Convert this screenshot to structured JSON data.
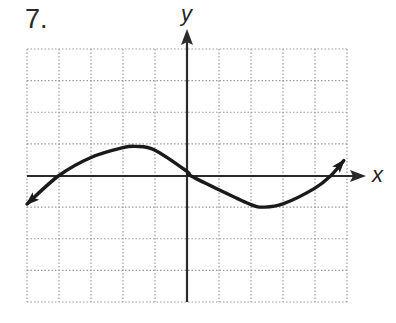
{
  "problem": {
    "number": "7."
  },
  "axes": {
    "x_label": "x",
    "y_label": "y"
  },
  "grid": {
    "columns": 10,
    "rows": 8,
    "x_min": -5,
    "x_max": 5,
    "y_min": -4,
    "y_max": 4,
    "line_style": "dotted",
    "line_color": "#9a9a9a"
  },
  "colors": {
    "curve": "#1a1a1a",
    "axis": "#2a2a2a",
    "background": "#ffffff"
  },
  "chart_data": {
    "type": "line",
    "title": "7.",
    "xlabel": "x",
    "ylabel": "y",
    "xlim": [
      -5,
      5
    ],
    "ylim": [
      -4,
      4
    ],
    "grid": true,
    "tick_labels": [],
    "series": [
      {
        "name": "curve",
        "arrows_both_ends": true,
        "x": [
          -5.0,
          -4.0,
          -3.0,
          -2.0,
          -1.6,
          -1.0,
          0.0,
          0.1,
          1.0,
          2.0,
          2.4,
          3.0,
          4.0,
          4.5,
          4.9
        ],
        "y": [
          -0.9,
          0.0,
          0.57,
          0.88,
          0.92,
          0.8,
          0.13,
          0.0,
          -0.45,
          -0.92,
          -1.0,
          -0.9,
          -0.4,
          0.0,
          0.47
        ]
      }
    ],
    "annotations": [
      "x-intercepts near x = -4, 0, 4.5",
      "local max near (-1.6, 0.9)",
      "local min near (2.4, -1)"
    ]
  }
}
